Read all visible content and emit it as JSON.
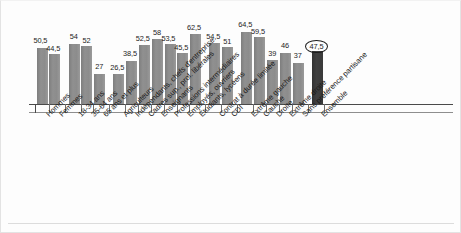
{
  "chart_data": {
    "type": "bar",
    "title": "",
    "subtitle": "",
    "xlabel": "",
    "ylabel": "",
    "ylim": [
      0,
      70
    ],
    "grid": false,
    "legend": "none",
    "orientation": "vertical",
    "value_label_format": "French decimal comma",
    "categories": [
      "Hommes",
      "Femmes",
      "18-34 ans",
      "35-64 ans",
      "65 ans et plus",
      "Agriculteurs",
      "Indépendants, chefs d'entreprise",
      "Cadres sup., prof. libérales",
      "Enseignants",
      "Professions intermédiaires",
      "Employés, ouvriers",
      "Étudiants, lycéens",
      "Contrat à durée limitée",
      "CDI",
      "Extrême gauche",
      "Gauche",
      "Droite",
      "Extrême droite",
      "Sans préférence partisane",
      "Ensemble"
    ],
    "values": [
      50.5,
      44.5,
      54,
      52,
      27,
      26.5,
      38.5,
      52.5,
      58,
      53.5,
      45.5,
      62.5,
      54.5,
      51,
      64.5,
      59.5,
      39,
      46,
      37,
      47.5
    ],
    "value_labels": [
      "50,5",
      "44,5",
      "54",
      "52",
      "27",
      "26,5",
      "38,5",
      "52,5",
      "58",
      "53,5",
      "45,5",
      "62,5",
      "54,5",
      "51",
      "64,5",
      "59,5",
      "39",
      "46",
      "37",
      "47,5"
    ],
    "highlight_index": 19,
    "highlight_label_circled": true,
    "groups": [
      {
        "name": "Sexe",
        "start": 0,
        "count": 2
      },
      {
        "name": "Âge",
        "start": 2,
        "count": 3
      },
      {
        "name": "Profession",
        "start": 5,
        "count": 7
      },
      {
        "name": "Contrat",
        "start": 12,
        "count": 2
      },
      {
        "name": "Préférence partisane",
        "start": 14,
        "count": 5
      },
      {
        "name": "Total",
        "start": 19,
        "count": 1
      }
    ],
    "colors": {
      "bar": "#8a8a8a",
      "bar_highlight": "#3b3b3b",
      "axis": "#4a4a4a",
      "text": "#1a1a1a",
      "background": "#fdfdfd"
    }
  }
}
